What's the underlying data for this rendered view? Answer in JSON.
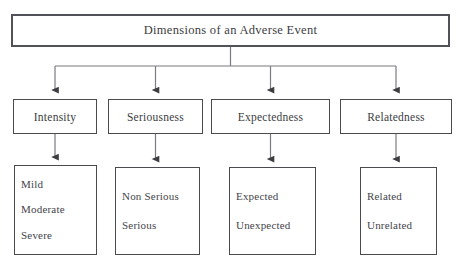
{
  "diagram": {
    "type": "hierarchy-flowchart",
    "title": "Dimensions of an Adverse Event",
    "stroke_color": "#4a4a4f",
    "text_color": "#3c3c42",
    "background_color": "#ffffff",
    "branches": [
      {
        "label": "Intensity",
        "values": [
          "Mild",
          "Moderate",
          "Severe"
        ]
      },
      {
        "label": "Seriousness",
        "values": [
          "Non Serious",
          "Serious"
        ]
      },
      {
        "label": "Expectedness",
        "values": [
          "Expected",
          "Unexpected"
        ]
      },
      {
        "label": "Relatedness",
        "values": [
          "Related",
          "Unrelated"
        ]
      }
    ],
    "caption": ""
  }
}
